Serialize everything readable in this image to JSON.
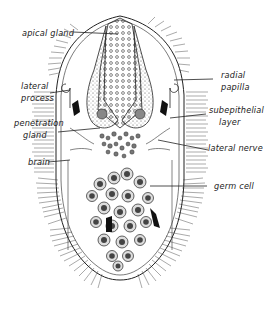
{
  "figure": {
    "labels": {
      "apical_gland": "apical gland",
      "lateral_process_1": "lateral",
      "lateral_process_2": "process",
      "penetration_gland_1": "penetration",
      "penetration_gland_2": "gland",
      "brain": "brain",
      "radial_papilla_1": "radial",
      "radial_papilla_2": "papilla",
      "subepithelial_layer_1": "subepithelial",
      "subepithelial_layer_2": "layer",
      "lateral_nerve": "lateral nerve",
      "germ_cell": "germ cell"
    },
    "colors": {
      "ink": "#222222",
      "background": "#ffffff"
    }
  }
}
